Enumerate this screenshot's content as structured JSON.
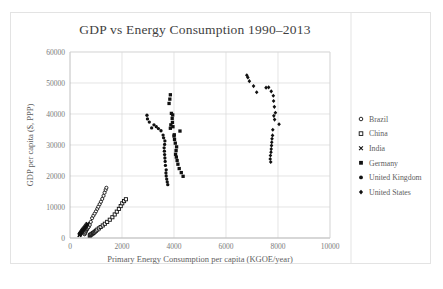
{
  "chart_data": {
    "type": "scatter",
    "title": "GDP vs Energy Consumption 1990–2013",
    "xlabel": "Primary Energy Consumption per capita (KGOE/year)",
    "ylabel": "GDP per capita ($, PPP)",
    "xlim": [
      0,
      10000
    ],
    "ylim": [
      0,
      60000
    ],
    "xticks": [
      0,
      2000,
      4000,
      6000,
      8000,
      10000
    ],
    "yticks": [
      0,
      10000,
      20000,
      30000,
      40000,
      50000,
      60000
    ],
    "xtick_labels": [
      "0",
      "2000",
      "4000",
      "6000",
      "8000",
      "10000"
    ],
    "ytick_labels": [
      "0",
      "10000",
      "20000",
      "30000",
      "40000",
      "50000",
      "60000"
    ],
    "grid": "horizontal-and-vertical",
    "legend_position": "right",
    "series": [
      {
        "name": "Brazil",
        "marker": "circle-open",
        "points": [
          [
            560,
            1200
          ],
          [
            575,
            1450
          ],
          [
            590,
            1800
          ],
          [
            610,
            2150
          ],
          [
            625,
            2400
          ],
          [
            640,
            2650
          ],
          [
            655,
            2900
          ],
          [
            670,
            3100
          ],
          [
            700,
            3350
          ],
          [
            720,
            3600
          ],
          [
            760,
            4200
          ],
          [
            800,
            5200
          ],
          [
            850,
            6400
          ],
          [
            900,
            7200
          ],
          [
            950,
            7900
          ],
          [
            1000,
            8600
          ],
          [
            1050,
            9400
          ],
          [
            1090,
            10100
          ],
          [
            1140,
            10900
          ],
          [
            1190,
            11700
          ],
          [
            1240,
            12600
          ],
          [
            1290,
            13600
          ],
          [
            1330,
            14600
          ],
          [
            1370,
            15500
          ],
          [
            1400,
            16200
          ]
        ]
      },
      {
        "name": "China",
        "marker": "square-open",
        "points": [
          [
            760,
            800
          ],
          [
            780,
            950
          ],
          [
            800,
            1100
          ],
          [
            830,
            1250
          ],
          [
            860,
            1400
          ],
          [
            890,
            1600
          ],
          [
            920,
            1800
          ],
          [
            960,
            2050
          ],
          [
            1000,
            2350
          ],
          [
            1050,
            2700
          ],
          [
            1110,
            3100
          ],
          [
            1180,
            3550
          ],
          [
            1260,
            4050
          ],
          [
            1340,
            4600
          ],
          [
            1430,
            5200
          ],
          [
            1530,
            5900
          ],
          [
            1630,
            6700
          ],
          [
            1720,
            7600
          ],
          [
            1800,
            8500
          ],
          [
            1880,
            9400
          ],
          [
            1950,
            10300
          ],
          [
            2010,
            11200
          ],
          [
            2080,
            11900
          ],
          [
            2150,
            12500
          ]
        ]
      },
      {
        "name": "India",
        "marker": "cross",
        "points": [
          [
            360,
            900
          ],
          [
            368,
            1000
          ],
          [
            376,
            1100
          ],
          [
            384,
            1200
          ],
          [
            392,
            1320
          ],
          [
            400,
            1430
          ],
          [
            410,
            1550
          ],
          [
            420,
            1680
          ],
          [
            430,
            1800
          ],
          [
            440,
            1950
          ],
          [
            452,
            2100
          ],
          [
            464,
            2250
          ],
          [
            476,
            2400
          ],
          [
            490,
            2560
          ],
          [
            505,
            2720
          ],
          [
            520,
            2900
          ],
          [
            540,
            3100
          ],
          [
            560,
            3300
          ],
          [
            580,
            3520
          ],
          [
            600,
            3750
          ],
          [
            620,
            3980
          ],
          [
            640,
            4200
          ],
          [
            660,
            4420
          ],
          [
            680,
            4600
          ]
        ]
      },
      {
        "name": "Germany",
        "marker": "square-filled",
        "points": [
          [
            4350,
            19900
          ],
          [
            4280,
            21100
          ],
          [
            4200,
            22400
          ],
          [
            4150,
            23800
          ],
          [
            4120,
            25000
          ],
          [
            4090,
            26100
          ],
          [
            4060,
            27000
          ],
          [
            4080,
            28200
          ],
          [
            4100,
            29400
          ],
          [
            4050,
            30600
          ],
          [
            4020,
            31800
          ],
          [
            4000,
            32900
          ],
          [
            4230,
            34500
          ],
          [
            4010,
            33300
          ],
          [
            3960,
            35900
          ],
          [
            3940,
            37300
          ],
          [
            3930,
            38600
          ],
          [
            3950,
            39700
          ],
          [
            3900,
            40200
          ],
          [
            3880,
            36500
          ],
          [
            3860,
            35400
          ],
          [
            3810,
            43400
          ],
          [
            3840,
            44800
          ],
          [
            3860,
            46200
          ]
        ]
      },
      {
        "name": "United Kingdom",
        "marker": "circle-filled",
        "points": [
          [
            3760,
            17200
          ],
          [
            3740,
            18100
          ],
          [
            3720,
            19000
          ],
          [
            3700,
            20000
          ],
          [
            3690,
            21000
          ],
          [
            3700,
            22000
          ],
          [
            3670,
            23400
          ],
          [
            3660,
            24700
          ],
          [
            3650,
            25800
          ],
          [
            3640,
            26900
          ],
          [
            3630,
            28000
          ],
          [
            3620,
            29100
          ],
          [
            3640,
            30200
          ],
          [
            3650,
            31300
          ],
          [
            3600,
            32300
          ],
          [
            3580,
            33200
          ],
          [
            3500,
            34600
          ],
          [
            3400,
            35300
          ],
          [
            3320,
            35900
          ],
          [
            3230,
            36500
          ],
          [
            3140,
            35500
          ],
          [
            3050,
            37400
          ],
          [
            2980,
            38400
          ],
          [
            2960,
            39600
          ]
        ]
      },
      {
        "name": "United States",
        "marker": "diamond-filled",
        "points": [
          [
            7720,
            24500
          ],
          [
            7700,
            25500
          ],
          [
            7710,
            26600
          ],
          [
            7730,
            27700
          ],
          [
            7740,
            28700
          ],
          [
            7750,
            29800
          ],
          [
            7760,
            30900
          ],
          [
            7770,
            32000
          ],
          [
            7790,
            33100
          ],
          [
            7800,
            34900
          ],
          [
            8040,
            36700
          ],
          [
            7870,
            38200
          ],
          [
            7840,
            39400
          ],
          [
            7900,
            40400
          ],
          [
            7860,
            42300
          ],
          [
            7830,
            44200
          ],
          [
            7820,
            45900
          ],
          [
            7740,
            47300
          ],
          [
            7640,
            48600
          ],
          [
            7540,
            48500
          ],
          [
            7180,
            47000
          ],
          [
            7060,
            49000
          ],
          [
            6900,
            50600
          ],
          [
            6800,
            52500
          ],
          [
            6840,
            51800
          ]
        ]
      }
    ]
  },
  "legend": {
    "items": [
      {
        "label": "Brazil"
      },
      {
        "label": "China"
      },
      {
        "label": "India"
      },
      {
        "label": "Germany"
      },
      {
        "label": "United Kingdom"
      },
      {
        "label": "United States"
      }
    ]
  },
  "colors": {
    "marker": "#111111",
    "grid": "#d9d9d9",
    "axis": "#b0b0b0",
    "text": "#5e5e5e",
    "title": "#3f3f3f",
    "background": "#ffffff",
    "frame": "#e3e3e3"
  }
}
